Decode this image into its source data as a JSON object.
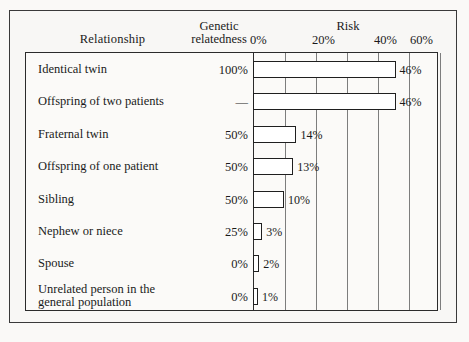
{
  "header": {
    "col_relationship": "Relationship",
    "col_genetic_line1": "Genetic",
    "col_genetic_line2": "relatedness",
    "col_risk": "Risk"
  },
  "axis": {
    "ticks": [
      "0%",
      "20%",
      "40%",
      "60%"
    ],
    "tick_values": [
      0,
      20,
      40,
      60
    ],
    "gridline_values": [
      10,
      20,
      30,
      40,
      50,
      60
    ]
  },
  "rows": [
    {
      "relationship": "Identical twin",
      "relatedness": "100%",
      "risk_label": "46%",
      "risk": 46
    },
    {
      "relationship": "Offspring of two patients",
      "relatedness": "—",
      "risk_label": "46%",
      "risk": 46
    },
    {
      "relationship": "Fraternal twin",
      "relatedness": "50%",
      "risk_label": "14%",
      "risk": 14
    },
    {
      "relationship": "Offspring of one patient",
      "relatedness": "50%",
      "risk_label": "13%",
      "risk": 13
    },
    {
      "relationship": "Sibling",
      "relatedness": "50%",
      "risk_label": "10%",
      "risk": 10
    },
    {
      "relationship": "Nephew or niece",
      "relatedness": "25%",
      "risk_label": "3%",
      "risk": 3
    },
    {
      "relationship": "Spouse",
      "relatedness": "0%",
      "risk_label": "2%",
      "risk": 2
    },
    {
      "relationship": "Unrelated person in the\ngeneral population",
      "relatedness": "0%",
      "risk_label": "1%",
      "risk": 1
    }
  ],
  "chart_data": {
    "type": "bar",
    "orientation": "horizontal",
    "title": "Risk",
    "xlabel": "Risk",
    "ylabel": "Relationship",
    "xlim": [
      0,
      60
    ],
    "xticks": [
      0,
      20,
      40,
      60
    ],
    "xticklabels": [
      "0%",
      "20%",
      "40%",
      "60%"
    ],
    "gridlines": [
      10,
      20,
      30,
      40,
      50,
      60
    ],
    "grid": true,
    "legend": null,
    "categories": [
      "Identical twin",
      "Offspring of two patients",
      "Fraternal twin",
      "Offspring of one patient",
      "Sibling",
      "Nephew or niece",
      "Spouse",
      "Unrelated person in the general population"
    ],
    "values": [
      46,
      46,
      14,
      13,
      10,
      3,
      2,
      1
    ],
    "data_labels": [
      "46%",
      "46%",
      "14%",
      "13%",
      "10%",
      "3%",
      "2%",
      "1%"
    ],
    "secondary_column": {
      "name": "Genetic relatedness",
      "values": [
        "100%",
        "—",
        "50%",
        "50%",
        "50%",
        "25%",
        "0%",
        "0%"
      ]
    },
    "bar_face_color": "#ffffff",
    "bar_edge_color": "#1f1f1f",
    "background_color": "#faf9f7"
  }
}
